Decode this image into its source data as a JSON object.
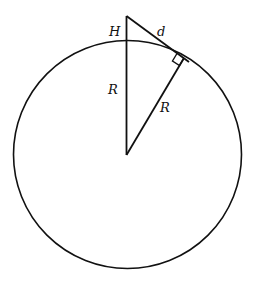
{
  "diagram": {
    "labels": {
      "height": "H",
      "distance": "d",
      "radius_vertical": "R",
      "radius_slant": "R"
    },
    "colors": {
      "stroke": "#111111",
      "background": "#ffffff"
    },
    "geometry": {
      "circle": {
        "cx": 127.5,
        "cy": 154.5,
        "r": 114
      },
      "apex": {
        "x": 126.5,
        "y": 16
      },
      "tangent_point": {
        "x": 184,
        "y": 58
      },
      "center": {
        "x": 126.5,
        "y": 154.5
      },
      "right_angle_marker": true
    }
  }
}
